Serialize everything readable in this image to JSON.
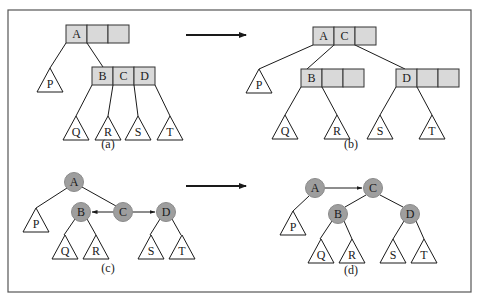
{
  "colors": {
    "background": "#ffffff",
    "frame": "#555555",
    "line": "#1a1a1a",
    "cell_fill": "#d9d9d9",
    "cell_stroke": "#333333",
    "circle_fill": "#9e9e9e",
    "circle_stroke": "#8a8a8a",
    "triangle_fill": "#ffffff",
    "text": "#1a1a1a"
  },
  "frame": {
    "x": 8,
    "y": 10,
    "w": 463,
    "h": 282
  },
  "arrows": [
    {
      "name": "transform-arrow-top",
      "x1": 186,
      "y1": 35,
      "x2": 246,
      "y2": 35,
      "width": 2.2
    },
    {
      "name": "transform-arrow-bottom",
      "x1": 186,
      "y1": 186,
      "x2": 246,
      "y2": 186,
      "width": 2.2
    }
  ],
  "panels": {
    "a": {
      "caption": "(a)",
      "caption_pos": [
        108,
        148
      ],
      "nodes": [
        {
          "name": "node-a",
          "x": 66,
          "y": 25,
          "cell_w": 21,
          "h": 18,
          "cells": [
            "A",
            "",
            ""
          ]
        },
        {
          "name": "node-bcd",
          "x": 92,
          "y": 67,
          "cell_w": 21,
          "h": 18,
          "cells": [
            "B",
            "C",
            "D"
          ]
        }
      ],
      "edges": [
        [
          66,
          43,
          50,
          68
        ],
        [
          87,
          43,
          103,
          67
        ],
        [
          92,
          85,
          76,
          116
        ],
        [
          113,
          85,
          108,
          116
        ],
        [
          134,
          85,
          138,
          116
        ],
        [
          155,
          85,
          170,
          116
        ]
      ],
      "subtrees": [
        {
          "label": "P",
          "cx": 50,
          "top": 68,
          "bottom": 92,
          "half": 13
        },
        {
          "label": "Q",
          "cx": 76,
          "top": 116,
          "bottom": 140,
          "half": 13
        },
        {
          "label": "R",
          "cx": 108,
          "top": 116,
          "bottom": 140,
          "half": 13
        },
        {
          "label": "S",
          "cx": 138,
          "top": 116,
          "bottom": 140,
          "half": 13
        },
        {
          "label": "T",
          "cx": 170,
          "top": 116,
          "bottom": 140,
          "half": 13
        }
      ]
    },
    "b": {
      "caption": "(b)",
      "caption_pos": [
        351,
        148
      ],
      "nodes": [
        {
          "name": "node-ac",
          "x": 313,
          "y": 27,
          "cell_w": 21,
          "h": 18,
          "cells": [
            "A",
            "C",
            ""
          ]
        },
        {
          "name": "node-b",
          "x": 301,
          "y": 69,
          "cell_w": 21,
          "h": 18,
          "cells": [
            "B",
            "",
            ""
          ]
        },
        {
          "name": "node-d",
          "x": 396,
          "y": 69,
          "cell_w": 21,
          "h": 18,
          "cells": [
            "D",
            "",
            ""
          ]
        }
      ],
      "edges": [
        [
          313,
          45,
          259,
          69
        ],
        [
          334,
          45,
          307,
          69
        ],
        [
          355,
          45,
          405,
          69
        ],
        [
          301,
          87,
          285,
          115
        ],
        [
          322,
          87,
          337,
          115
        ],
        [
          396,
          87,
          380,
          115
        ],
        [
          417,
          87,
          432,
          115
        ]
      ],
      "subtrees": [
        {
          "label": "P",
          "cx": 259,
          "top": 69,
          "bottom": 93,
          "half": 13
        },
        {
          "label": "Q",
          "cx": 285,
          "top": 115,
          "bottom": 139,
          "half": 13
        },
        {
          "label": "R",
          "cx": 337,
          "top": 115,
          "bottom": 139,
          "half": 13
        },
        {
          "label": "S",
          "cx": 380,
          "top": 115,
          "bottom": 139,
          "half": 13
        },
        {
          "label": "T",
          "cx": 432,
          "top": 115,
          "bottom": 139,
          "half": 13
        }
      ]
    },
    "c": {
      "caption": "(c)",
      "caption_pos": [
        108,
        272
      ],
      "circles": [
        {
          "label": "A",
          "cx": 74,
          "cy": 182,
          "r": 9.5
        },
        {
          "label": "B",
          "cx": 81,
          "cy": 212,
          "r": 9.5
        },
        {
          "label": "C",
          "cx": 123,
          "cy": 212,
          "r": 9.5
        },
        {
          "label": "D",
          "cx": 166,
          "cy": 212,
          "r": 9.5
        }
      ],
      "edges": [
        [
          67,
          188,
          36,
          208
        ],
        [
          82,
          187,
          116,
          206
        ],
        [
          75,
          219,
          64,
          235
        ],
        [
          87,
          219,
          96,
          235
        ],
        [
          160,
          219,
          150,
          235
        ],
        [
          172,
          219,
          181,
          235
        ]
      ],
      "pointers": [
        {
          "name": "pointer-c-to-b",
          "x1": 113,
          "y1": 212,
          "x2": 92,
          "y2": 212
        },
        {
          "name": "pointer-c-to-d",
          "x1": 133,
          "y1": 212,
          "x2": 155,
          "y2": 212
        }
      ],
      "subtrees": [
        {
          "label": "P",
          "cx": 36,
          "top": 208,
          "bottom": 232,
          "half": 13
        },
        {
          "label": "Q",
          "cx": 65,
          "top": 235,
          "bottom": 259,
          "half": 13
        },
        {
          "label": "R",
          "cx": 96,
          "top": 235,
          "bottom": 259,
          "half": 13
        },
        {
          "label": "S",
          "cx": 151,
          "top": 235,
          "bottom": 259,
          "half": 13
        },
        {
          "label": "T",
          "cx": 182,
          "top": 235,
          "bottom": 259,
          "half": 13
        }
      ]
    },
    "d": {
      "caption": "(d)",
      "caption_pos": [
        351,
        274
      ],
      "circles": [
        {
          "label": "A",
          "cx": 315,
          "cy": 188,
          "r": 9.5
        },
        {
          "label": "C",
          "cx": 373,
          "cy": 188,
          "r": 9.5
        },
        {
          "label": "B",
          "cx": 338,
          "cy": 214,
          "r": 9.5
        },
        {
          "label": "D",
          "cx": 410,
          "cy": 214,
          "r": 9.5
        }
      ],
      "edges": [
        [
          309,
          196,
          293,
          211
        ],
        [
          366,
          195,
          345,
          207
        ],
        [
          380,
          195,
          403,
          207
        ],
        [
          332,
          221,
          320,
          239
        ],
        [
          344,
          221,
          352,
          239
        ],
        [
          404,
          221,
          393,
          239
        ],
        [
          416,
          221,
          424,
          239
        ]
      ],
      "pointers": [
        {
          "name": "pointer-a-to-c",
          "x1": 325,
          "y1": 188,
          "x2": 362,
          "y2": 188
        }
      ],
      "subtrees": [
        {
          "label": "P",
          "cx": 293,
          "top": 211,
          "bottom": 235,
          "half": 13
        },
        {
          "label": "Q",
          "cx": 321,
          "top": 239,
          "bottom": 263,
          "half": 13
        },
        {
          "label": "R",
          "cx": 352,
          "top": 239,
          "bottom": 263,
          "half": 13
        },
        {
          "label": "S",
          "cx": 393,
          "top": 239,
          "bottom": 263,
          "half": 13
        },
        {
          "label": "T",
          "cx": 424,
          "top": 239,
          "bottom": 263,
          "half": 13
        }
      ]
    }
  }
}
